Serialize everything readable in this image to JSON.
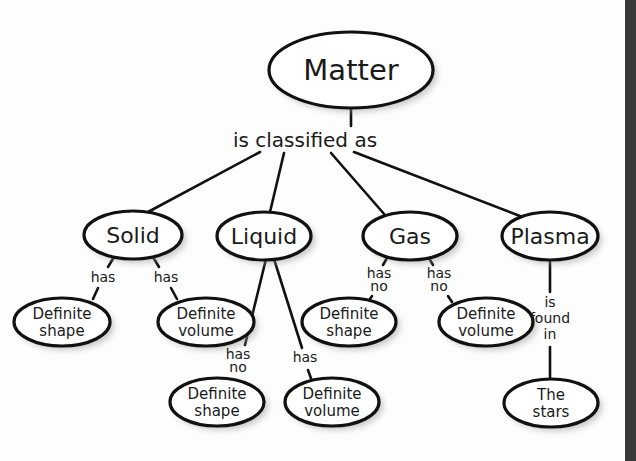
{
  "diagram": {
    "root": {
      "label": "Matter"
    },
    "root_link": "is classified as",
    "states": [
      {
        "label": "Solid"
      },
      {
        "label": "Liquid"
      },
      {
        "label": "Gas"
      },
      {
        "label": "Plasma"
      }
    ],
    "solid": {
      "links": [
        "has",
        "has"
      ],
      "children": [
        {
          "line1": "Definite",
          "line2": "shape"
        },
        {
          "line1": "Definite",
          "line2": "volume"
        }
      ]
    },
    "liquid": {
      "links": [
        {
          "line1": "has",
          "line2": "no"
        },
        {
          "line1": "has",
          "line2": ""
        }
      ],
      "children": [
        {
          "line1": "Definite",
          "line2": "shape"
        },
        {
          "line1": "Definite",
          "line2": "volume"
        }
      ]
    },
    "gas": {
      "links": [
        {
          "line1": "has",
          "line2": "no"
        },
        {
          "line1": "has",
          "line2": "no"
        }
      ],
      "children": [
        {
          "line1": "Definite",
          "line2": "shape"
        },
        {
          "line1": "Definite",
          "line2": "volume"
        }
      ]
    },
    "plasma": {
      "link": {
        "line1": "is",
        "line2": "found",
        "line3": "in"
      },
      "child": {
        "line1": "The",
        "line2": "stars"
      }
    }
  }
}
